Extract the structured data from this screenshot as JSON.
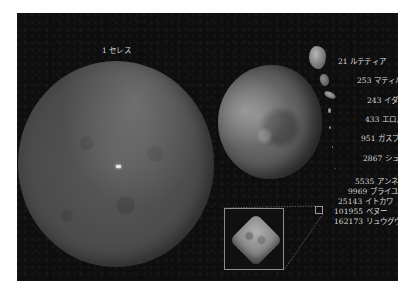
{
  "figure": {
    "background_color": "#0e0e0e",
    "label_color": "#d8d8d8"
  },
  "bodies": {
    "ceres": {
      "label": "1 セレス",
      "number": 1,
      "name": "セレス"
    },
    "vesta": {
      "label": "4 ベスタ",
      "number": 4,
      "name": "ベスタ"
    },
    "lutetia": {
      "label": "21 ルテティア",
      "number": 21,
      "name": "ルテティア"
    },
    "mathilde": {
      "label": "253 マティルド",
      "number": 253,
      "name": "マティルド"
    },
    "ida": {
      "label": "243 イダ",
      "number": 243,
      "name": "イダ"
    },
    "eros": {
      "label": "433 エロス",
      "number": 433,
      "name": "エロス"
    },
    "gaspra": {
      "label": "951 ガスプラ",
      "number": 951,
      "name": "ガスプラ"
    },
    "steins": {
      "label": "2867 シュテインス",
      "number": 2867,
      "name": "シュテインス"
    },
    "annefrank": {
      "label": "5535 アンネフランク",
      "number": 5535,
      "name": "アンネフランク"
    },
    "braille": {
      "label": "9969 ブライユ",
      "number": 9969,
      "name": "ブライユ"
    },
    "itokawa": {
      "label": "25143 イトカワ",
      "number": 25143,
      "name": "イトカワ"
    },
    "bennu": {
      "label": "101955 ベヌー",
      "number": 101955,
      "name": "ベヌー"
    },
    "ryugu": {
      "label": "162173 リュウグウ",
      "number": 162173,
      "name": "リュウグウ"
    }
  },
  "inset": {
    "subject": "162173 リュウグウ",
    "zoomed": true
  }
}
